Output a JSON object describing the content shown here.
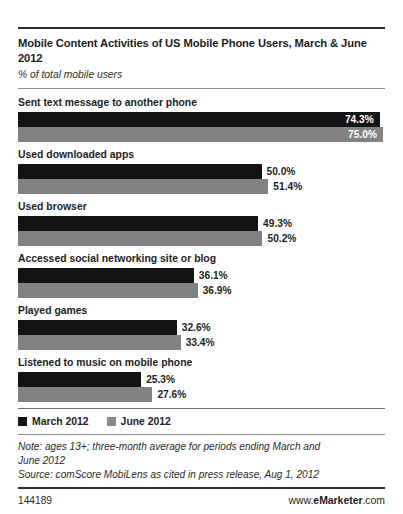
{
  "header": {
    "title": "Mobile Content Activities of US Mobile Phone Users, March & June 2012",
    "subtitle": "% of total mobile users"
  },
  "legend": {
    "items": [
      {
        "label": "March 2012",
        "color": "#141414"
      },
      {
        "label": "June 2012",
        "color": "#828282"
      }
    ]
  },
  "notes": {
    "note_line1": "Note: ages 13+; three-month average for periods ending March and",
    "note_line2": "June 2012",
    "source": "Source: comScore MobiLens as cited in press release, Aug 1, 2012"
  },
  "footer": {
    "id": "144189",
    "url_prefix": "www.",
    "url_brand": "eMarketer",
    "url_suffix": ".com"
  },
  "chart_data": {
    "type": "bar",
    "orientation": "horizontal",
    "title": "Mobile Content Activities of US Mobile Phone Users, March & June 2012",
    "subtitle": "% of total mobile users",
    "xlabel": "",
    "ylabel": "",
    "xlim": [
      0,
      75
    ],
    "grid": false,
    "legend_position": "bottom-left",
    "value_suffix": "%",
    "categories": [
      "Sent text message to another phone",
      "Used downloaded apps",
      "Used browser",
      "Accessed social networking site or blog",
      "Played games",
      "Listened to music on mobile phone"
    ],
    "series": [
      {
        "name": "March 2012",
        "color": "#141414",
        "values": [
          74.3,
          50.0,
          49.3,
          36.1,
          32.6,
          25.3
        ]
      },
      {
        "name": "June 2012",
        "color": "#828282",
        "values": [
          75.0,
          51.4,
          50.2,
          36.9,
          33.4,
          27.6
        ]
      }
    ],
    "labels": [
      {
        "march": "74.3%",
        "june": "75.0%"
      },
      {
        "march": "50.0%",
        "june": "51.4%"
      },
      {
        "march": "49.3%",
        "june": "50.2%"
      },
      {
        "march": "36.1%",
        "june": "36.9%"
      },
      {
        "march": "32.6%",
        "june": "33.4%"
      },
      {
        "march": "25.3%",
        "june": "27.6%"
      }
    ]
  }
}
